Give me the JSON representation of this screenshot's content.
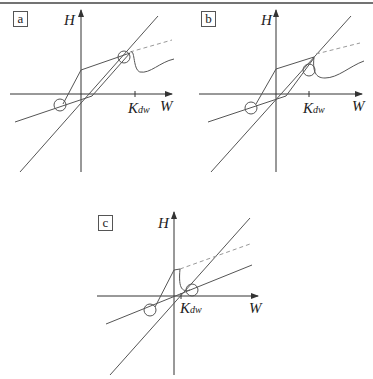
{
  "figure": {
    "panels": [
      {
        "id": "a",
        "label": "a",
        "y_axis": "H",
        "x_axis": "W",
        "tick": "K",
        "tick_sub": "dw"
      },
      {
        "id": "b",
        "label": "b",
        "y_axis": "H",
        "x_axis": "W",
        "tick": "K",
        "tick_sub": "dw"
      },
      {
        "id": "c",
        "label": "c",
        "y_axis": "H",
        "x_axis": "W",
        "tick": "K",
        "tick_sub": "dw"
      }
    ],
    "line_color": "#555555",
    "dash_color": "#999999"
  }
}
